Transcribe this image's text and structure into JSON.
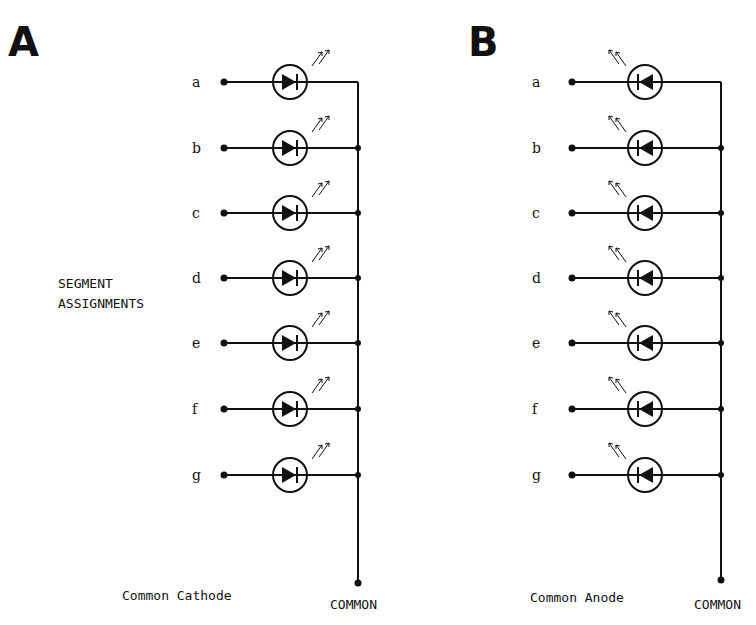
{
  "panels": [
    {
      "id": "A",
      "letter": "A",
      "caption": "Common Cathode",
      "common_label": "COMMON",
      "diode_direction": "right",
      "arrow_direction": "out-right",
      "segments": [
        "a",
        "b",
        "c",
        "d",
        "e",
        "f",
        "g"
      ]
    },
    {
      "id": "B",
      "letter": "B",
      "caption": "Common Anode",
      "common_label": "COMMON",
      "diode_direction": "left",
      "arrow_direction": "out-left",
      "segments": [
        "a",
        "b",
        "c",
        "d",
        "e",
        "f",
        "g"
      ]
    }
  ],
  "side_label": {
    "line1": "SEGMENT",
    "line2": "ASSIGNMENTS"
  },
  "colors": {
    "ink": "#111111",
    "background": "#ffffff"
  }
}
